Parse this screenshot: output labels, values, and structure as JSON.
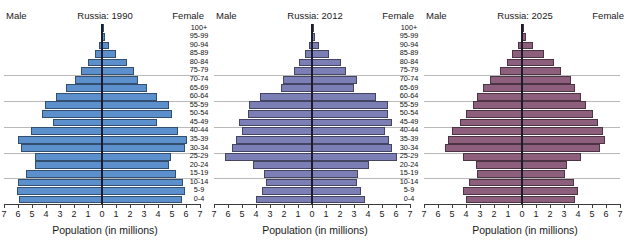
{
  "figure": {
    "xlabel": "Population (in millions)",
    "male_label": "Male",
    "female_label": "Female",
    "age_groups": [
      "100+",
      "95-99",
      "90-94",
      "85-89",
      "80-84",
      "75-79",
      "70-74",
      "65-69",
      "60-64",
      "55-59",
      "50-54",
      "45-49",
      "40-44",
      "35-39",
      "30-34",
      "25-29",
      "20-24",
      "15-19",
      "10-14",
      "5-9",
      "0-4"
    ],
    "tick_values_left": [
      "7",
      "6",
      "5",
      "4",
      "3",
      "2",
      "1",
      "0"
    ],
    "tick_values_right": [
      "0",
      "1",
      "2",
      "3",
      "4",
      "5",
      "6",
      "7"
    ],
    "axis_max": 7,
    "gridline_after_indices": [
      5,
      8,
      11,
      14,
      17
    ]
  },
  "chart_data": {
    "type": "bar",
    "xlabel": "Population (in millions)",
    "ylabel": "Age group",
    "xlim": [
      -7,
      7
    ],
    "grid": true,
    "legend": "none",
    "categories": [
      "100+",
      "95-99",
      "90-94",
      "85-89",
      "80-84",
      "75-79",
      "70-74",
      "65-69",
      "60-64",
      "55-59",
      "50-54",
      "45-49",
      "40-44",
      "35-39",
      "30-34",
      "25-29",
      "20-24",
      "15-19",
      "10-14",
      "5-9",
      "0-4"
    ],
    "panels": [
      {
        "title": "Russia: 1990",
        "color": "#5b90cc",
        "series": [
          {
            "name": "Male",
            "values": [
              0.02,
              0.1,
              0.25,
              0.5,
              1.0,
              1.5,
              1.9,
              2.6,
              3.3,
              4.1,
              4.3,
              3.5,
              5.1,
              6.0,
              5.8,
              4.8,
              4.8,
              5.4,
              6.0,
              6.1,
              5.9
            ]
          },
          {
            "name": "Female",
            "values": [
              0.03,
              0.2,
              0.5,
              1.0,
              1.8,
              2.3,
              2.6,
              3.2,
              3.9,
              4.8,
              5.0,
              3.9,
              5.4,
              6.1,
              5.9,
              4.9,
              4.8,
              5.3,
              5.8,
              5.9,
              5.7
            ]
          }
        ]
      },
      {
        "title": "Russia: 2012",
        "color": "#7b7fb5",
        "series": [
          {
            "name": "Male",
            "values": [
              0.01,
              0.1,
              0.2,
              0.5,
              0.9,
              1.3,
              2.1,
              2.2,
              3.7,
              4.5,
              4.6,
              5.2,
              5.0,
              5.4,
              5.7,
              6.2,
              4.2,
              3.4,
              3.3,
              3.6,
              4.0
            ]
          },
          {
            "name": "Female",
            "values": [
              0.03,
              0.2,
              0.5,
              1.2,
              2.1,
              2.4,
              3.2,
              3.0,
              4.6,
              5.4,
              5.4,
              5.7,
              5.2,
              5.5,
              5.7,
              6.1,
              4.1,
              3.3,
              3.2,
              3.5,
              3.8
            ]
          }
        ]
      },
      {
        "title": "Russia: 2025",
        "color": "#8d5f7c",
        "series": [
          {
            "name": "Male",
            "values": [
              0.02,
              0.1,
              0.3,
              0.7,
              1.1,
              1.6,
              2.3,
              2.8,
              3.2,
              3.5,
              4.0,
              4.4,
              5.0,
              5.3,
              5.5,
              4.2,
              3.3,
              3.2,
              3.8,
              4.2,
              4.0
            ]
          },
          {
            "name": "Female",
            "values": [
              0.05,
              0.3,
              0.8,
              1.6,
              2.3,
              2.8,
              3.5,
              3.8,
              4.2,
              4.6,
              5.1,
              5.4,
              5.8,
              5.9,
              5.6,
              4.2,
              3.2,
              3.1,
              3.7,
              4.0,
              3.8
            ]
          }
        ]
      }
    ]
  }
}
